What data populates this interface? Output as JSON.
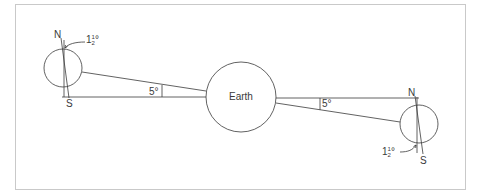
{
  "diagram": {
    "colors": {
      "stroke": "#3a3a3a",
      "frame": "#c9c9c9",
      "background": "#ffffff"
    },
    "earth": {
      "label": "Earth"
    },
    "left_body": {
      "north_label": "N",
      "south_label": "S",
      "tilt_label_whole": "1",
      "tilt_label_num": "1",
      "tilt_label_den": "2",
      "tilt_label_deg": "°"
    },
    "right_body": {
      "north_label": "N",
      "south_label": "S",
      "tilt_label_whole": "1",
      "tilt_label_num": "1",
      "tilt_label_den": "2",
      "tilt_label_deg": "°"
    },
    "angles": {
      "left": "5°",
      "right": "5°"
    }
  }
}
